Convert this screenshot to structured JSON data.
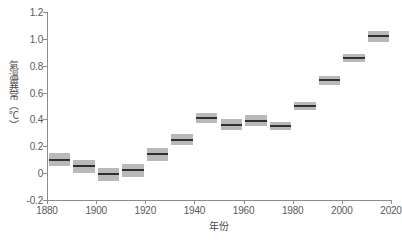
{
  "chart_data": {
    "type": "bar",
    "title": "",
    "subtitle": "",
    "xlabel": "年份",
    "ylabel": "氣溫異常（℃）",
    "xlim": [
      1880,
      2020
    ],
    "ylim": [
      -0.2,
      1.2
    ],
    "xticks": [
      1880,
      1900,
      1920,
      1940,
      1960,
      1980,
      2000,
      2020
    ],
    "xtick_labels": [
      "1880",
      "1900",
      "1920",
      "1940",
      "1960",
      "1980",
      "2000",
      "2020"
    ],
    "yticks": [
      -0.2,
      0,
      0.2,
      0.4,
      0.6,
      0.8,
      1.0,
      1.2
    ],
    "ytick_labels": [
      "-0.2",
      "0",
      "0.2",
      "0.4",
      "0.6",
      "0.8",
      "1.0",
      "1.2"
    ],
    "grid": false,
    "legend": false,
    "legend_position": "none",
    "categories": [
      "1880s",
      "1890s",
      "1900s",
      "1910s",
      "1920s",
      "1930s",
      "1940s",
      "1950s",
      "1960s",
      "1970s",
      "1980s",
      "1990s",
      "2000s",
      "2010s"
    ],
    "x_start": [
      1880,
      1890,
      1900,
      1910,
      1920,
      1930,
      1940,
      1950,
      1960,
      1970,
      1980,
      1990,
      2000,
      2010
    ],
    "x_end": [
      1890,
      1900,
      1910,
      1920,
      1930,
      1940,
      1950,
      1960,
      1970,
      1980,
      1990,
      2000,
      2010,
      2020
    ],
    "values": [
      0.1,
      0.05,
      -0.01,
      0.02,
      0.14,
      0.25,
      0.41,
      0.36,
      0.39,
      0.35,
      0.5,
      0.69,
      0.86,
      1.02
    ],
    "uncertainty_low": [
      0.05,
      0.0,
      -0.06,
      -0.03,
      0.09,
      0.21,
      0.37,
      0.32,
      0.35,
      0.32,
      0.47,
      0.66,
      0.83,
      0.98
    ],
    "uncertainty_high": [
      0.15,
      0.1,
      0.04,
      0.07,
      0.19,
      0.29,
      0.45,
      0.4,
      0.43,
      0.38,
      0.53,
      0.72,
      0.89,
      1.06
    ],
    "colors": {
      "box": "#b9b9b9",
      "median": "#303030",
      "axis": "#8c8c8c",
      "text": "#4a4a4a",
      "background": "#ffffff"
    }
  }
}
